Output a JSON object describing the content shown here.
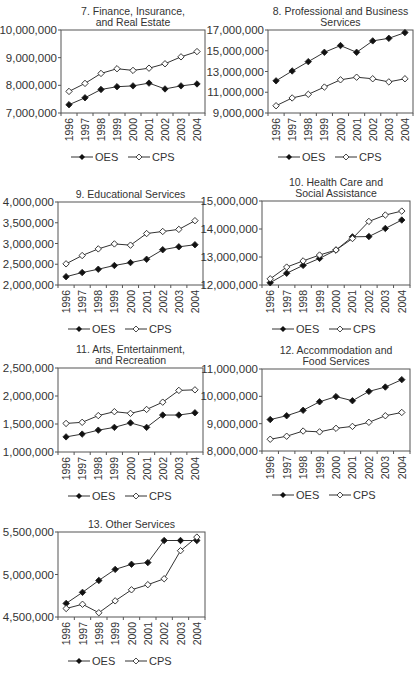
{
  "legend": {
    "oes_label": "OES",
    "cps_label": "CPS"
  },
  "colors": {
    "line": "#333333",
    "oes_marker": "#111111",
    "cps_marker_fill": "#ffffff"
  },
  "chart_data": [
    {
      "type": "line",
      "title": "7. Finance, Insurance, and Real Estate",
      "title_lines": [
        "7. Finance, Insurance,",
        "and Real Estate"
      ],
      "categories": [
        "1996",
        "1997",
        "1998",
        "1999",
        "2000",
        "2001",
        "2002",
        "2003",
        "2004"
      ],
      "yticks": [
        "7,000,000",
        "8,000,000",
        "9,000,000",
        "10,000,000"
      ],
      "ylim": [
        7000000,
        10000000
      ],
      "series": [
        {
          "name": "OES",
          "values": [
            7300000,
            7550000,
            7850000,
            7950000,
            7980000,
            8080000,
            7870000,
            7980000,
            8050000
          ]
        },
        {
          "name": "CPS",
          "values": [
            7780000,
            8070000,
            8430000,
            8600000,
            8540000,
            8620000,
            8780000,
            9030000,
            9220000
          ]
        }
      ],
      "legend_position": "bottom",
      "grid": false
    },
    {
      "type": "line",
      "title": "8. Professional and Business Services",
      "title_lines": [
        "8. Professional and Business",
        "Services"
      ],
      "categories": [
        "1996",
        "1997",
        "1998",
        "1999",
        "2000",
        "2001",
        "2002",
        "2003",
        "2004"
      ],
      "yticks": [
        "9,000,000",
        "11,000,000",
        "13,000,000",
        "15,000,000",
        "17,000,000"
      ],
      "ylim": [
        9000000,
        17000000
      ],
      "series": [
        {
          "name": "OES",
          "values": [
            12100000,
            13050000,
            13950000,
            14850000,
            15500000,
            14850000,
            15950000,
            16200000,
            16750000
          ]
        },
        {
          "name": "CPS",
          "values": [
            9700000,
            10450000,
            10800000,
            11500000,
            12200000,
            12450000,
            12300000,
            12000000,
            12300000
          ]
        }
      ],
      "legend_position": "bottom",
      "grid": false
    },
    {
      "type": "line",
      "title": "9. Educational Services",
      "title_lines": [
        "9. Educational Services"
      ],
      "categories": [
        "1996",
        "1997",
        "1998",
        "1999",
        "2000",
        "2001",
        "2002",
        "2003",
        "2004"
      ],
      "yticks": [
        "2,000,000",
        "2,500,000",
        "3,000,000",
        "3,500,000",
        "4,000,000"
      ],
      "ylim": [
        2000000,
        4000000
      ],
      "series": [
        {
          "name": "OES",
          "values": [
            2200000,
            2300000,
            2380000,
            2470000,
            2540000,
            2620000,
            2850000,
            2920000,
            2970000
          ]
        },
        {
          "name": "CPS",
          "values": [
            2510000,
            2710000,
            2870000,
            2990000,
            2960000,
            3240000,
            3290000,
            3340000,
            3550000
          ]
        }
      ],
      "legend_position": "bottom",
      "grid": false
    },
    {
      "type": "line",
      "title": "10. Health Care and Social Assistance",
      "title_lines": [
        "10. Health Care and",
        "Social Assistance"
      ],
      "categories": [
        "1996",
        "1997",
        "1998",
        "1999",
        "2000",
        "2001",
        "2002",
        "2003",
        "2004"
      ],
      "yticks": [
        "12,000,000",
        "13,000,000",
        "14,000,000",
        "15,000,000"
      ],
      "ylim": [
        12000000,
        15000000
      ],
      "series": [
        {
          "name": "OES",
          "values": [
            12080000,
            12420000,
            12700000,
            12950000,
            13250000,
            13720000,
            13730000,
            14020000,
            14320000
          ]
        },
        {
          "name": "CPS",
          "values": [
            12220000,
            12640000,
            12860000,
            13070000,
            13250000,
            13660000,
            14270000,
            14500000,
            14640000
          ]
        }
      ],
      "legend_position": "bottom",
      "grid": false
    },
    {
      "type": "line",
      "title": "11. Arts, Entertainment, and Recreation",
      "title_lines": [
        "11. Arts, Entertainment,",
        "and Recreation"
      ],
      "categories": [
        "1996",
        "1997",
        "1998",
        "1999",
        "2000",
        "2001",
        "2002",
        "2003",
        "2004"
      ],
      "yticks": [
        "1,000,000",
        "1,500,000",
        "2,000,000",
        "2,500,000"
      ],
      "ylim": [
        1000000,
        2500000
      ],
      "series": [
        {
          "name": "OES",
          "values": [
            1270000,
            1320000,
            1390000,
            1440000,
            1520000,
            1440000,
            1660000,
            1660000,
            1700000
          ]
        },
        {
          "name": "CPS",
          "values": [
            1510000,
            1530000,
            1650000,
            1720000,
            1690000,
            1760000,
            1890000,
            2100000,
            2110000
          ]
        }
      ],
      "legend_position": "bottom",
      "grid": false
    },
    {
      "type": "line",
      "title": "12. Accommodation and Food Services",
      "title_lines": [
        "12. Accommodation and",
        "Food Services"
      ],
      "categories": [
        "1996",
        "1997",
        "1998",
        "1999",
        "2000",
        "2001",
        "2002",
        "2003",
        "2004"
      ],
      "yticks": [
        "8,000,000",
        "9,000,000",
        "10,000,000",
        "11,000,000"
      ],
      "ylim": [
        8000000,
        11000000
      ],
      "series": [
        {
          "name": "OES",
          "values": [
            9150000,
            9290000,
            9490000,
            9800000,
            9990000,
            9840000,
            10180000,
            10340000,
            10610000
          ]
        },
        {
          "name": "CPS",
          "values": [
            8430000,
            8540000,
            8730000,
            8700000,
            8830000,
            8900000,
            9050000,
            9290000,
            9410000
          ]
        }
      ],
      "legend_position": "bottom",
      "grid": false
    },
    {
      "type": "line",
      "title": "13. Other Services",
      "title_lines": [
        "13. Other Services"
      ],
      "categories": [
        "1996",
        "1997",
        "1998",
        "1999",
        "2000",
        "2001",
        "2002",
        "2003",
        "2004"
      ],
      "yticks": [
        "4,500,000",
        "5,000,000",
        "5,500,000"
      ],
      "ylim": [
        4500000,
        5500000
      ],
      "series": [
        {
          "name": "OES",
          "values": [
            4660000,
            4790000,
            4930000,
            5060000,
            5120000,
            5140000,
            5400000,
            5400000,
            5400000
          ]
        },
        {
          "name": "CPS",
          "values": [
            4600000,
            4650000,
            4550000,
            4690000,
            4820000,
            4880000,
            4950000,
            5280000,
            5440000
          ]
        }
      ],
      "legend_position": "bottom",
      "grid": false
    }
  ]
}
